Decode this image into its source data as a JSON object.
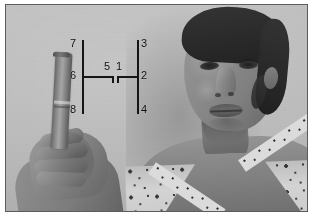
{
  "image": {
    "kind": "grayscale-photograph",
    "description": "Grayscale studio photograph of a woman with a hand in the foreground holding a cylindrical object, overlaid with a measurement line diagram",
    "frame_border_color": "#5a5c5e",
    "backdrop_color": "#bcbcba",
    "page_background": "#ffffff"
  },
  "subject": {
    "person": "woman facing camera, hair pulled back, patterned light blouse",
    "foreground_object": "cylindrical object held in hand at left"
  },
  "overlay": {
    "name": "measurement-diagram",
    "line_color": "#151515",
    "label_color": "#0d0d0d",
    "markers": [
      {
        "id": "1",
        "label": "1",
        "x": 116,
        "y": 61
      },
      {
        "id": "2",
        "label": "2",
        "x": 141,
        "y": 70
      },
      {
        "id": "3",
        "label": "3",
        "x": 141,
        "y": 38
      },
      {
        "id": "4",
        "label": "4",
        "x": 141,
        "y": 104
      },
      {
        "id": "5",
        "label": "5",
        "x": 104,
        "y": 61
      },
      {
        "id": "6",
        "label": "6",
        "x": 70,
        "y": 70
      },
      {
        "id": "7",
        "label": "7",
        "x": 70,
        "y": 38
      },
      {
        "id": "8",
        "label": "8",
        "x": 70,
        "y": 104
      }
    ],
    "segments": [
      {
        "id": "left-vertical",
        "orientation": "vertical",
        "x": 82,
        "y": 40,
        "length": 74
      },
      {
        "id": "right-vertical",
        "orientation": "vertical",
        "x": 137,
        "y": 40,
        "length": 74
      },
      {
        "id": "horizontal-left",
        "orientation": "horizontal",
        "x": 82,
        "y": 76,
        "length": 31
      },
      {
        "id": "horizontal-right",
        "orientation": "horizontal",
        "x": 117,
        "y": 76,
        "length": 21
      },
      {
        "id": "tick-left-inner",
        "orientation": "vertical",
        "x": 112,
        "y": 76,
        "length": 7
      },
      {
        "id": "tick-right-inner",
        "orientation": "vertical",
        "x": 117,
        "y": 76,
        "length": 7
      }
    ]
  }
}
